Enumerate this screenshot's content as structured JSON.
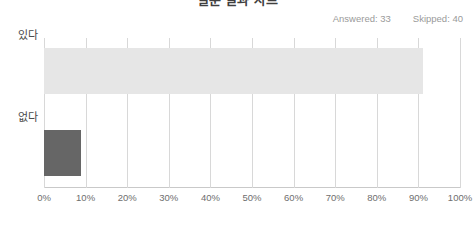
{
  "title": "설문 결과 차트",
  "summary": {
    "answered_label": "Answered: 33",
    "skipped_label": "Skipped: 40"
  },
  "colors": {
    "bar_light": "#e6e6e6",
    "bar_dark": "#666666",
    "gridline": "#d8d8d8",
    "axis": "#c9c9c9",
    "tick_text": "#6e6e6e",
    "category_text": "#4a4a4a",
    "summary_text": "#9a9a9a"
  },
  "chart_data": {
    "type": "bar",
    "orientation": "horizontal",
    "title": "설문 결과 차트",
    "categories": [
      "있다",
      "없다"
    ],
    "values": [
      91,
      9
    ],
    "bar_colors": [
      "#e6e6e6",
      "#666666"
    ],
    "xlabel": "",
    "ylabel": "",
    "xlim": [
      0,
      100
    ],
    "xticks": [
      0,
      10,
      20,
      30,
      40,
      50,
      60,
      70,
      80,
      90,
      100
    ],
    "xtick_labels": [
      "0%",
      "10%",
      "20%",
      "30%",
      "40%",
      "50%",
      "60%",
      "70%",
      "80%",
      "90%",
      "100%"
    ],
    "grid": true,
    "grid_axis": "x",
    "legend": false,
    "annotations": [
      "Answered: 33",
      "Skipped: 40"
    ]
  }
}
